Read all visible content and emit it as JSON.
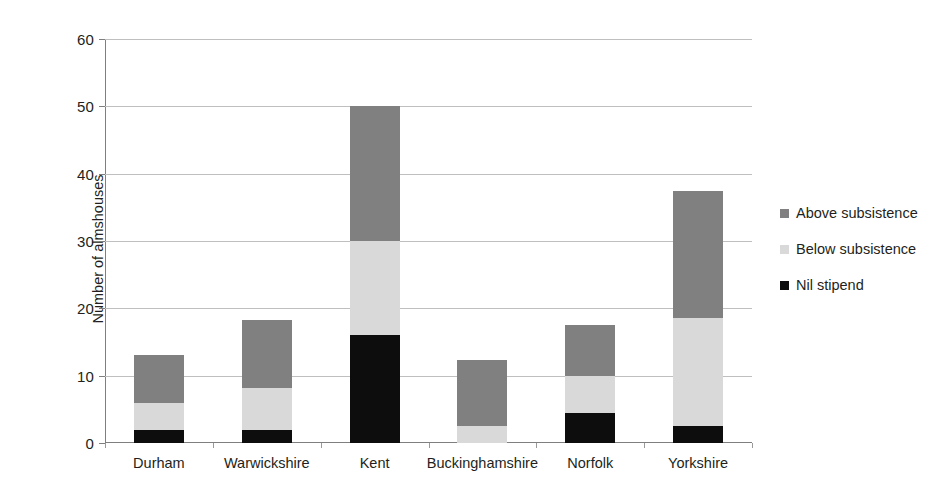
{
  "chart_data": {
    "type": "bar",
    "subtype": "stacked-bar",
    "title": "",
    "xlabel": "",
    "ylabel": "Number of almshouses",
    "ylim": [
      0,
      60
    ],
    "yticks": [
      0,
      10,
      20,
      30,
      40,
      50,
      60
    ],
    "grid": true,
    "legend_position": "right",
    "categories": [
      "Durham",
      "Warwickshire",
      "Kent",
      "Buckinghamshire",
      "Norfolk",
      "Yorkshire"
    ],
    "series": [
      {
        "name": "Nil stipend",
        "color": "#0d0d0d",
        "values": [
          2,
          2,
          16,
          0,
          4.5,
          2.5
        ]
      },
      {
        "name": "Below subsistence",
        "color": "#d9d9d9",
        "values": [
          4,
          6.2,
          14,
          2.5,
          5.5,
          16
        ]
      },
      {
        "name": "Above subsistence",
        "color": "#808080",
        "values": [
          7,
          10,
          20,
          9.8,
          7.5,
          19
        ]
      }
    ],
    "totals": [
      13,
      18.2,
      50,
      12.3,
      17.5,
      37.5
    ],
    "stack_order_bottom_to_top": [
      "Nil stipend",
      "Below subsistence",
      "Above subsistence"
    ]
  },
  "legend": {
    "items": [
      {
        "label": "Above subsistence",
        "color": "#808080"
      },
      {
        "label": "Below subsistence",
        "color": "#d9d9d9"
      },
      {
        "label": "Nil stipend",
        "color": "#0d0d0d"
      }
    ]
  },
  "axis": {
    "y_title": "Number of almshouses",
    "y_tick_labels": [
      "0",
      "10",
      "20",
      "30",
      "40",
      "50",
      "60"
    ],
    "x_tick_labels": [
      "Durham",
      "Warwickshire",
      "Kent",
      "Buckinghamshire",
      "Norfolk",
      "Yorkshire"
    ]
  }
}
